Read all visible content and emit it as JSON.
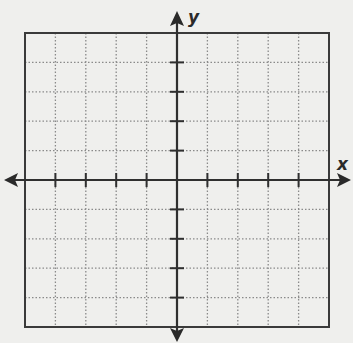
{
  "chart_data": {
    "type": "coordinate-grid",
    "title": "",
    "xlabel": "x",
    "ylabel": "y",
    "xlim": [
      -5,
      5
    ],
    "ylim": [
      -5,
      5
    ],
    "grid": true,
    "grid_style": "dotted",
    "tick_interval": 1,
    "tick_labels": false,
    "data_points": []
  },
  "colors": {
    "background": "#efefed",
    "axis": "#2f2f2f",
    "grid": "#8a8a8a",
    "border": "#3a3a3a"
  },
  "labels": {
    "x_axis": "x",
    "y_axis": "y"
  }
}
